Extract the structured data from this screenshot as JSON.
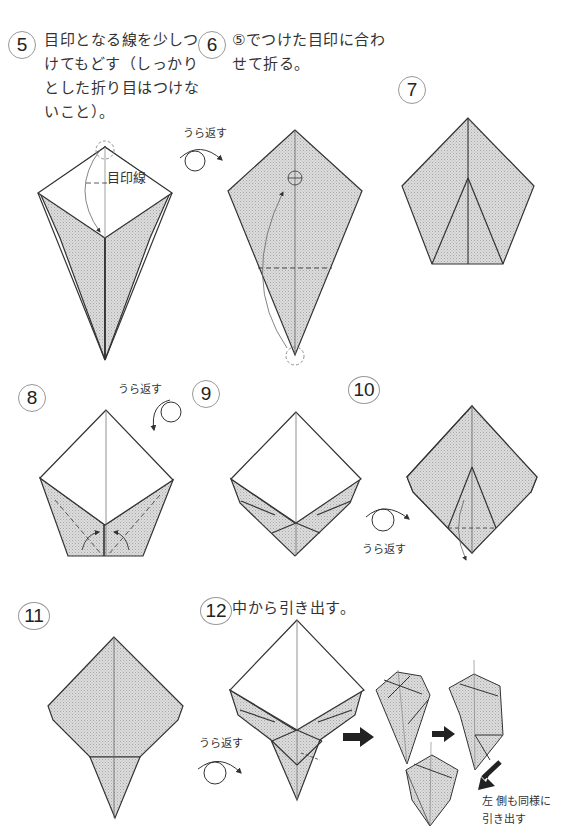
{
  "page": {
    "type": "origami instruction diagram",
    "colors": {
      "paper_back": "#d4d4d4",
      "paper_front": "#ffffff",
      "line": "#333333",
      "background": "#ffffff"
    }
  },
  "steps": [
    {
      "number": "5",
      "instruction_lines": [
        "目印となる線を少しつ",
        "けてもどす（しっかり",
        "とした折り目はつけな",
        "いこと）。"
      ],
      "label": "目印線"
    },
    {
      "number": "6",
      "instruction_lines": [
        "⑤でつけた目印に合わ",
        "せて折る。"
      ]
    },
    {
      "number": "7"
    },
    {
      "number": "8"
    },
    {
      "number": "9"
    },
    {
      "number": "10"
    },
    {
      "number": "11"
    },
    {
      "number": "12",
      "instruction_lines": [
        "中から引き出す。"
      ],
      "note_lines": [
        "左 側も同様に",
        "引き出す"
      ]
    }
  ],
  "labels": {
    "turn_over": "うら返す"
  }
}
